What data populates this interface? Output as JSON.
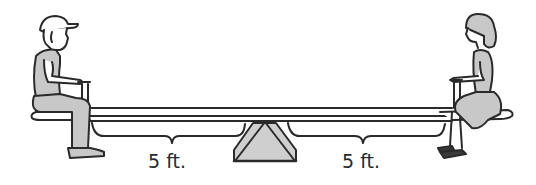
{
  "diagram": {
    "type": "seesaw-balance",
    "labels": {
      "left_distance": "5 ft.",
      "right_distance": "5 ft."
    },
    "figures": {
      "left": "boy-with-cap",
      "right": "girl-in-dress"
    },
    "colors": {
      "outline": "#2a2a2a",
      "fill_gray": "#c8c8c8",
      "background": "#ffffff"
    }
  }
}
